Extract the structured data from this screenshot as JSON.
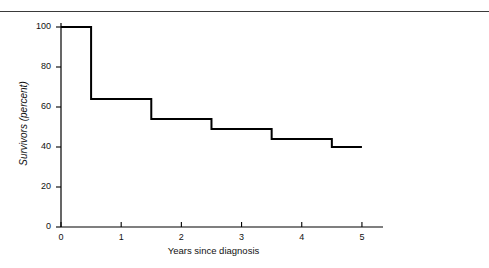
{
  "figure": {
    "top_rule_color": "#3a3a3a",
    "background_color": "#ffffff"
  },
  "chart_data": {
    "type": "line",
    "subtype": "step-post",
    "title": "",
    "subtitle": "",
    "xlabel": "Years since diagnosis",
    "ylabel": "Survivors (percent)",
    "xlim": [
      0,
      5.35
    ],
    "ylim": [
      0,
      100
    ],
    "xticks": [
      0,
      1,
      2,
      3,
      4,
      5
    ],
    "xtick_labels": [
      "0",
      "1",
      "2",
      "3",
      "4",
      "5"
    ],
    "yticks": [
      0,
      20,
      40,
      60,
      80,
      100
    ],
    "ytick_labels": [
      "0",
      "20",
      "40",
      "60",
      "80",
      "100"
    ],
    "grid": false,
    "legend": null,
    "legend_position": "none",
    "line_color": "#000000",
    "line_width": 2,
    "axis_color": "#000000",
    "series": [
      {
        "name": "Survival",
        "x": [
          0,
          0.5,
          1.5,
          2.5,
          3.5,
          4.5,
          5.0
        ],
        "values": [
          100,
          64,
          54,
          49,
          44,
          40,
          40
        ]
      }
    ],
    "steps": [
      {
        "x_start": 0.0,
        "x_end": 0.5,
        "y": 100
      },
      {
        "x_start": 0.5,
        "x_end": 1.5,
        "y": 64
      },
      {
        "x_start": 1.5,
        "x_end": 2.5,
        "y": 54
      },
      {
        "x_start": 2.5,
        "x_end": 3.5,
        "y": 49
      },
      {
        "x_start": 3.5,
        "x_end": 4.5,
        "y": 44
      },
      {
        "x_start": 4.5,
        "x_end": 5.0,
        "y": 40
      }
    ],
    "annotations": []
  }
}
